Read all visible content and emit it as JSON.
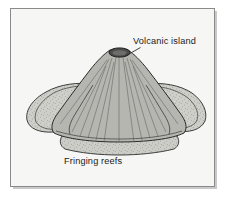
{
  "figure": {
    "frame": {
      "name": "diagram-border",
      "x": 10.5,
      "y": 8.5,
      "width": 204,
      "height": 178,
      "stroke_color": "#8a8a8a",
      "shadow_color": "#c9c9c9",
      "background_color": "#f6f6f4"
    },
    "labels": [
      {
        "id": "volcanic-island",
        "text": "Volcanic island",
        "x": 133,
        "y": 44,
        "anchor": "start",
        "leader": {
          "from_x": 140.5,
          "from_y": 47.5,
          "to_x": 124.5,
          "to_y": 56.5,
          "color": "#2b2b2b"
        }
      },
      {
        "id": "fringing-reefs",
        "text": "Fringing reefs",
        "x": 64,
        "y": 164,
        "anchor": "start",
        "leader": null
      }
    ],
    "elements": {
      "crater": {
        "name": "summit-crater",
        "cx": 119.5,
        "cy": 52.5,
        "rx": 10.5,
        "ry": 4.6,
        "fill": "#4c4c4a",
        "stroke": "#1e1e1e"
      },
      "volcano_cone": {
        "name": "volcano-cone",
        "fill": "#b6b6b1",
        "stroke": "#2a2a2a"
      },
      "reef_left": {
        "name": "fringing-reef-left-lobe",
        "fill": "#cfcfca",
        "stroke": "#2a2a2a"
      },
      "reef_right": {
        "name": "fringing-reef-right-lobe",
        "fill": "#cfcfca",
        "stroke": "#2a2a2a"
      },
      "reef_front": {
        "name": "fringing-reef-front-band",
        "fill": "#cdcdc8",
        "stroke": "#2a2a2a"
      },
      "gully_color": "#6e6e6a"
    },
    "colors": {
      "page_background": "#ffffff",
      "panel_background": "#f6f6f4",
      "ink": "#1b1b1b",
      "rock_gray": "#b6b6b1",
      "reef_gray": "#cfcfca",
      "crater_dark": "#4c4c4a"
    }
  }
}
